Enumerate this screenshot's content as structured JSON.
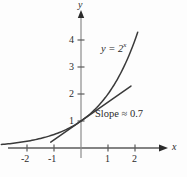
{
  "figure": {
    "background_color": "#fdfdfd",
    "ink_color": "#2b2b2b"
  },
  "chart_data": {
    "type": "line",
    "title": "",
    "subtitle": "",
    "xlabel": "x",
    "ylabel": "y",
    "xlim": [
      -2.95,
      2.45
    ],
    "ylim": [
      -0.5,
      4.45
    ],
    "grid": false,
    "legend": "none",
    "xticks": [
      -2,
      -1,
      1,
      2
    ],
    "xtick_labels": [
      "-2",
      "-1",
      "1",
      "2"
    ],
    "yticks": [
      1,
      2,
      3,
      4
    ],
    "ytick_labels": [
      "1",
      "2",
      "3",
      "4"
    ],
    "axis_arrows": [
      "x-positive",
      "y-positive"
    ],
    "series": [
      {
        "name": "y = 2^x",
        "kind": "exponential-curve",
        "label": "y = 2",
        "label_exponent": "x",
        "formula_base": 2,
        "x_start": -2.95,
        "x_end": 2.1,
        "points": [
          {
            "x": -2.95,
            "y": 0.129
          },
          {
            "x": -2.6,
            "y": 0.165
          },
          {
            "x": -2.2,
            "y": 0.218
          },
          {
            "x": -1.8,
            "y": 0.287
          },
          {
            "x": -1.4,
            "y": 0.379
          },
          {
            "x": -1.0,
            "y": 0.5
          },
          {
            "x": -0.6,
            "y": 0.66
          },
          {
            "x": -0.3,
            "y": 0.812
          },
          {
            "x": 0.0,
            "y": 1.0
          },
          {
            "x": 0.3,
            "y": 1.231
          },
          {
            "x": 0.6,
            "y": 1.516
          },
          {
            "x": 1.0,
            "y": 2.0
          },
          {
            "x": 1.4,
            "y": 2.639
          },
          {
            "x": 1.8,
            "y": 3.482
          },
          {
            "x": 2.1,
            "y": 4.287
          }
        ]
      },
      {
        "name": "tangent line at x = 0",
        "kind": "tangent-line",
        "slope": 0.7,
        "intercept": 1.0,
        "x_start": -1.12,
        "x_end": 1.85,
        "points": [
          {
            "x": -1.12,
            "y": 0.216
          },
          {
            "x": 1.85,
            "y": 2.295
          }
        ]
      }
    ],
    "annotations": [
      {
        "name": "slope-annotation",
        "text": "Slope ≈ 0.7",
        "x": 0.55,
        "y": 0.82
      },
      {
        "name": "curve-equation-label",
        "text": "y = 2",
        "exponent": "x",
        "x": 0.78,
        "y": 3.28
      }
    ]
  }
}
